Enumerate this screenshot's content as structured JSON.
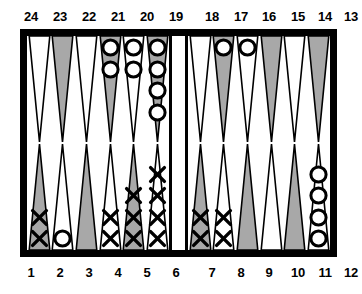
{
  "board": {
    "title": "Backgammon board position diagram",
    "colors": {
      "frame": "#000000",
      "felt": "#ffffff",
      "point_shaded": "#a8a8a8",
      "point_light": "#ffffff",
      "outline": "#000000",
      "checker_o": "#ffffff",
      "checker_x": "#000000"
    },
    "top_labels": [
      "24",
      "23",
      "22",
      "21",
      "20",
      "19",
      "18",
      "17",
      "16",
      "15",
      "14",
      "13"
    ],
    "bottom_labels": [
      "1",
      "2",
      "3",
      "4",
      "5",
      "6",
      "7",
      "8",
      "9",
      "10",
      "11",
      "12"
    ],
    "checker_symbols": {
      "o": "O",
      "x": "X"
    },
    "points": [
      {
        "number": "24",
        "row": "top",
        "quadrant": "top-left",
        "index": 0,
        "shade": "light",
        "checkers": 0,
        "checker_type": ""
      },
      {
        "number": "23",
        "row": "top",
        "quadrant": "top-left",
        "index": 1,
        "shade": "shaded",
        "checkers": 0,
        "checker_type": ""
      },
      {
        "number": "22",
        "row": "top",
        "quadrant": "top-left",
        "index": 2,
        "shade": "light",
        "checkers": 0,
        "checker_type": ""
      },
      {
        "number": "21",
        "row": "top",
        "quadrant": "top-left",
        "index": 3,
        "shade": "shaded",
        "checkers": 2,
        "checker_type": "o"
      },
      {
        "number": "20",
        "row": "top",
        "quadrant": "top-left",
        "index": 4,
        "shade": "light",
        "checkers": 2,
        "checker_type": "o"
      },
      {
        "number": "19",
        "row": "top",
        "quadrant": "top-left",
        "index": 5,
        "shade": "shaded",
        "checkers": 4,
        "checker_type": "o"
      },
      {
        "number": "18",
        "row": "top",
        "quadrant": "top-right",
        "index": 0,
        "shade": "light",
        "checkers": 0,
        "checker_type": ""
      },
      {
        "number": "17",
        "row": "top",
        "quadrant": "top-right",
        "index": 1,
        "shade": "shaded",
        "checkers": 1,
        "checker_type": "o"
      },
      {
        "number": "16",
        "row": "top",
        "quadrant": "top-right",
        "index": 2,
        "shade": "light",
        "checkers": 1,
        "checker_type": "o"
      },
      {
        "number": "15",
        "row": "top",
        "quadrant": "top-right",
        "index": 3,
        "shade": "shaded",
        "checkers": 0,
        "checker_type": ""
      },
      {
        "number": "14",
        "row": "top",
        "quadrant": "top-right",
        "index": 4,
        "shade": "light",
        "checkers": 0,
        "checker_type": ""
      },
      {
        "number": "13",
        "row": "top",
        "quadrant": "top-right",
        "index": 5,
        "shade": "shaded",
        "checkers": 0,
        "checker_type": ""
      },
      {
        "number": "1",
        "row": "bottom",
        "quadrant": "bottom-left",
        "index": 0,
        "shade": "shaded",
        "checkers": 2,
        "checker_type": "x"
      },
      {
        "number": "2",
        "row": "bottom",
        "quadrant": "bottom-left",
        "index": 1,
        "shade": "light",
        "checkers": 1,
        "checker_type": "o"
      },
      {
        "number": "3",
        "row": "bottom",
        "quadrant": "bottom-left",
        "index": 2,
        "shade": "shaded",
        "checkers": 0,
        "checker_type": ""
      },
      {
        "number": "4",
        "row": "bottom",
        "quadrant": "bottom-left",
        "index": 3,
        "shade": "light",
        "checkers": 2,
        "checker_type": "x"
      },
      {
        "number": "5",
        "row": "bottom",
        "quadrant": "bottom-left",
        "index": 4,
        "shade": "shaded",
        "checkers": 3,
        "checker_type": "x"
      },
      {
        "number": "6",
        "row": "bottom",
        "quadrant": "bottom-left",
        "index": 5,
        "shade": "light",
        "checkers": 4,
        "checker_type": "x"
      },
      {
        "number": "7",
        "row": "bottom",
        "quadrant": "bottom-right",
        "index": 0,
        "shade": "shaded",
        "checkers": 2,
        "checker_type": "x"
      },
      {
        "number": "8",
        "row": "bottom",
        "quadrant": "bottom-right",
        "index": 1,
        "shade": "light",
        "checkers": 2,
        "checker_type": "x"
      },
      {
        "number": "9",
        "row": "bottom",
        "quadrant": "bottom-right",
        "index": 2,
        "shade": "shaded",
        "checkers": 0,
        "checker_type": ""
      },
      {
        "number": "10",
        "row": "bottom",
        "quadrant": "bottom-right",
        "index": 3,
        "shade": "light",
        "checkers": 0,
        "checker_type": ""
      },
      {
        "number": "11",
        "row": "bottom",
        "quadrant": "bottom-right",
        "index": 4,
        "shade": "shaded",
        "checkers": 0,
        "checker_type": ""
      },
      {
        "number": "12",
        "row": "bottom",
        "quadrant": "bottom-right",
        "index": 5,
        "shade": "light",
        "checkers": 4,
        "checker_type": "o"
      }
    ]
  }
}
